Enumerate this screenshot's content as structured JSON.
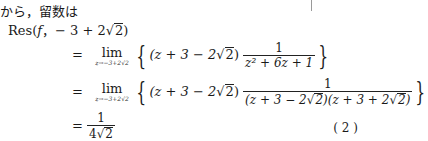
{
  "document": {
    "intro_text": "から，留数は",
    "residue_heading": {
      "func": "Res",
      "open": "(",
      "f": "f",
      "comma": "，",
      "point": "− 3 + 2",
      "sqrt_arg": "2",
      "close": ")"
    },
    "rows": [
      {
        "equals": "=",
        "lim": "lim",
        "lim_sub": "z→−3+2√2",
        "factor_prefix": "(z + 3 − 2",
        "factor_sqrt": "2",
        "factor_close": ")",
        "frac_num": "1",
        "frac_den": "z² + 6z + 1"
      },
      {
        "equals": "=",
        "lim": "lim",
        "lim_sub": "z→−3+2√2",
        "factor_prefix": "(z + 3 − 2",
        "factor_sqrt": "2",
        "factor_close": ")",
        "frac_num": "1",
        "frac_den_a": "(z + 3 − 2",
        "frac_den_a_sqrt": "2",
        "frac_den_a_close": ")",
        "frac_den_b": "(z + 3 + 2",
        "frac_den_b_sqrt": "2",
        "frac_den_b_close": ")"
      },
      {
        "equals": "=",
        "frac_num": "1",
        "frac_den": "4",
        "frac_den_sqrt": "2"
      }
    ],
    "equation_tag": "( 2 )"
  }
}
